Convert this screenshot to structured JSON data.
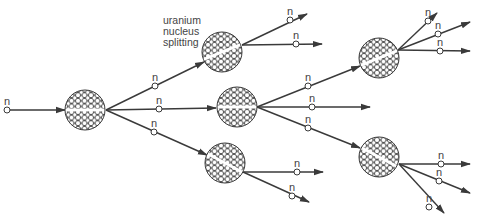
{
  "diagram": {
    "caption_lines": [
      "uranium",
      "nucleus",
      "splitting"
    ],
    "neutron_label": "n",
    "colors": {
      "line": "#3a3a3a",
      "nucleus_fill": "#ffffff",
      "background": "#ffffff"
    },
    "nuclei": [
      {
        "id": "n1",
        "cx": 85,
        "cy": 110,
        "r": 20,
        "split_angle": 0
      },
      {
        "id": "nA",
        "cx": 222,
        "cy": 52,
        "r": 20,
        "split_angle": -22
      },
      {
        "id": "nB",
        "cx": 237,
        "cy": 107,
        "r": 20,
        "split_angle": 0
      },
      {
        "id": "nC",
        "cx": 225,
        "cy": 163,
        "r": 20,
        "split_angle": 28
      },
      {
        "id": "nD",
        "cx": 379,
        "cy": 58,
        "r": 20,
        "split_angle": -22
      },
      {
        "id": "nE",
        "cx": 379,
        "cy": 157,
        "r": 20,
        "split_angle": 28
      }
    ],
    "neutrons": [
      {
        "x1": 7,
        "y1": 110,
        "x2": 65,
        "y2": 110,
        "nx": 7,
        "ny": 110
      },
      {
        "x1": 106,
        "y1": 110,
        "x2": 204,
        "y2": 62,
        "nx": 155,
        "ny": 86
      },
      {
        "x1": 106,
        "y1": 110,
        "x2": 216,
        "y2": 108,
        "nx": 159,
        "ny": 109
      },
      {
        "x1": 106,
        "y1": 110,
        "x2": 207,
        "y2": 155,
        "nx": 154,
        "ny": 132
      },
      {
        "x1": 242,
        "y1": 45,
        "x2": 307,
        "y2": 14,
        "nx": 290,
        "ny": 20
      },
      {
        "x1": 242,
        "y1": 45,
        "x2": 322,
        "y2": 44,
        "nx": 296,
        "ny": 44
      },
      {
        "x1": 257,
        "y1": 107,
        "x2": 360,
        "y2": 66,
        "nx": 308,
        "ny": 86
      },
      {
        "x1": 257,
        "y1": 107,
        "x2": 370,
        "y2": 107,
        "nx": 312,
        "ny": 107
      },
      {
        "x1": 257,
        "y1": 107,
        "x2": 360,
        "y2": 148,
        "nx": 308,
        "ny": 128
      },
      {
        "x1": 243,
        "y1": 172,
        "x2": 323,
        "y2": 172,
        "nx": 297,
        "ny": 172
      },
      {
        "x1": 243,
        "y1": 172,
        "x2": 309,
        "y2": 202,
        "nx": 292,
        "ny": 196
      },
      {
        "x1": 398,
        "y1": 50,
        "x2": 437,
        "y2": 13,
        "nx": 428,
        "ny": 21
      },
      {
        "x1": 398,
        "y1": 50,
        "x2": 470,
        "y2": 22,
        "nx": 438,
        "ny": 34
      },
      {
        "x1": 398,
        "y1": 50,
        "x2": 470,
        "y2": 51,
        "nx": 440,
        "ny": 51
      },
      {
        "x1": 399,
        "y1": 164,
        "x2": 470,
        "y2": 164,
        "nx": 441,
        "ny": 164
      },
      {
        "x1": 399,
        "y1": 164,
        "x2": 470,
        "y2": 193,
        "nx": 439,
        "ny": 181
      },
      {
        "x1": 399,
        "y1": 164,
        "x2": 444,
        "y2": 213,
        "nx": 429,
        "ny": 207
      }
    ]
  }
}
